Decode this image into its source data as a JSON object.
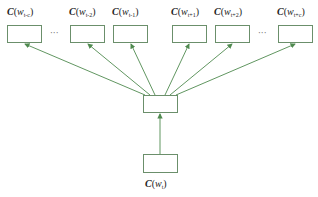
{
  "diagram": {
    "type": "skip-gram architecture",
    "colors": {
      "arrow": "#4f8a4f",
      "box_border": "#6b8f6b",
      "text": "#222222"
    },
    "output_nodes": [
      {
        "label": "C(w_{t-c})",
        "prefix": "C(w",
        "sub": "t-c",
        "suffix": ")"
      },
      {
        "label": "C(w_{t-2})",
        "prefix": "C(w",
        "sub": "t-2",
        "suffix": ")"
      },
      {
        "label": "C(w_{t-1})",
        "prefix": "C(w",
        "sub": "t-1",
        "suffix": ")"
      },
      {
        "label": "C(w_{t+1})",
        "prefix": "C(w",
        "sub": "t+1",
        "suffix": ")"
      },
      {
        "label": "C(w_{t+2})",
        "prefix": "C(w",
        "sub": "t+2",
        "suffix": ")"
      },
      {
        "label": "C(w_{t+c})",
        "prefix": "C(w",
        "sub": "t+c",
        "suffix": ")"
      }
    ],
    "ellipsis": "···",
    "hidden_node": {
      "label": ""
    },
    "input_node": {
      "label": "C(w_t)",
      "prefix": "C(w",
      "sub": "t",
      "suffix": ")"
    }
  }
}
